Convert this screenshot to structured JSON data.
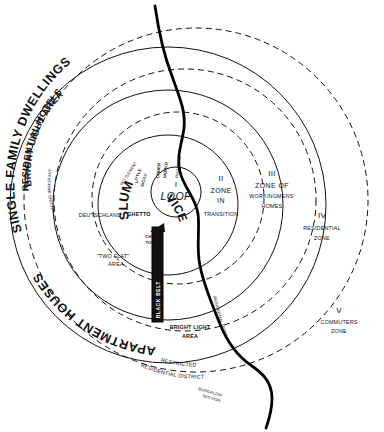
{
  "figure": {
    "kind": "concentric-zone-diagram",
    "ink_color": "#111111",
    "paper_color": "#ffffff",
    "black_belt_fill": "#111111"
  },
  "zones": [
    {
      "numeral": "I",
      "name": "LOOP"
    },
    {
      "numeral": "II",
      "name_line1": "ZONE",
      "name_line2": "IN",
      "name_line3": "TRANSITION"
    },
    {
      "numeral": "III",
      "name_line1": "ZONE OF",
      "name_line2": "WORKINGMENS'",
      "name_line3": "HOMES"
    },
    {
      "numeral": "IV",
      "name_line1": "RESIDENTIAL",
      "name_line2": "ZONE"
    },
    {
      "numeral": "V",
      "name_line1": "COMMUTERS",
      "name_line2": "ZONE"
    }
  ],
  "arc_labels": {
    "single_family_dwellings": "SINGLE FAMILY DWELLINGS",
    "residential_hotels_outer": "RESIDENTIAL HOTELS",
    "bright_light_area_top": "BRIGHT LIGHT AREA",
    "apartment_houses": "APARTMENT HOUSES",
    "restricted_residential_district_line1": "RESTRICTED",
    "restricted_residential_district_line2": "RESIDENTIAL DISTRICT",
    "bungalow_section_line1": "BUNGALOW",
    "bungalow_section_line2": "SECTION",
    "residential_hotels_river": "RESIDENTIAL HOTELS"
  },
  "inner_labels": {
    "little_sicily_line1": "LITTLE",
    "little_sicily_line2": "SICILY",
    "under_world_line1": "UNDER",
    "under_world_line2": "WORLD",
    "roomers": "ROOMERS",
    "slum": "SLUM",
    "vice": "VICE",
    "ghetto": "GHETTO",
    "china_town_line1": "CHINA",
    "china_town_line2": "TOWN",
    "deutschland": "DEUTSCHLAND",
    "second_immigrant_settlement_line1": "SECOND IMMIGRANT",
    "second_immigrant_settlement_line2": "SETTLEMENT",
    "two_flat_area_line1": "\"TWO FLAT\"",
    "two_flat_area_line2": "AREA",
    "black_belt": "BLACK BELT",
    "bright_light_area_bottom_line1": "BRIGHT LIGHT",
    "bright_light_area_bottom_line2": "AREA"
  }
}
